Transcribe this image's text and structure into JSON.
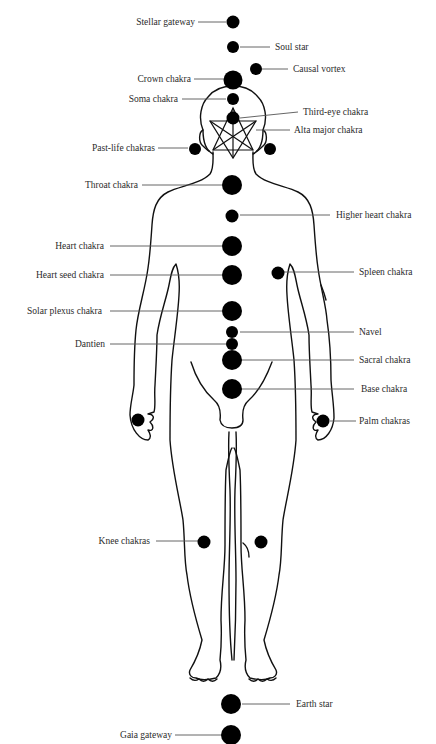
{
  "figure": {
    "cut_title_fragment": "",
    "labels": {
      "stellar_gateway": "Stellar gateway",
      "soul_star": "Soul star",
      "causal_vortex": "Causal vortex",
      "crown": "Crown chakra",
      "soma": "Soma chakra",
      "third_eye": "Third-eye chakra",
      "alta_major": "Alta major chakra",
      "past_life": "Past-life chakras",
      "throat": "Throat chakra",
      "higher_heart": "Higher heart chakra",
      "heart": "Heart chakra",
      "heart_seed": "Heart seed chakra",
      "spleen": "Spleen chakra",
      "solar_plexus": "Solar plexus chakra",
      "navel": "Navel",
      "dantien": "Dantien",
      "sacral": "Sacral chakra",
      "base": "Base chakra",
      "palm": "Palm chakras",
      "knee": "Knee chakras",
      "earth_star": "Earth star",
      "gaia_gateway": "Gaia gateway"
    },
    "colors": {
      "dot": "#000000",
      "line": "#555555",
      "outline": "#111111"
    }
  }
}
